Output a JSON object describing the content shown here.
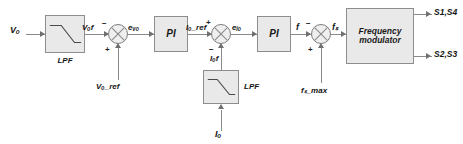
{
  "diagram": {
    "colors": {
      "block_fill": "#e9e9e9",
      "block_border": "#8d8d8d",
      "wire": "#8a8a8a",
      "text": "#141414",
      "background": "#ffffff"
    }
  },
  "signals": {
    "input_vo": "Vₒ",
    "vof": "Vₒf",
    "evo": "eᵥₒ",
    "io_ref": "Iₒ_ref",
    "eio": "eᵢₒ",
    "iof": "Iₒf",
    "f": "f",
    "fs": "fₛ",
    "fs_max": "fₛ_max",
    "vo_ref": "Vₒ_ref",
    "input_io": "Iₒ"
  },
  "blocks": {
    "lpf_voltage": {
      "label": "LPF",
      "caption_position": "below"
    },
    "pi_voltage": {
      "label": "PI"
    },
    "pi_current": {
      "label": "PI"
    },
    "lpf_current": {
      "label": "LPF",
      "caption_position": "right"
    },
    "modulator": {
      "label_line1": "Frequency",
      "label_line2": "modulator"
    }
  },
  "summing_junctions": {
    "voltage": {
      "left_sign": "−",
      "bottom_sign": "+"
    },
    "current": {
      "left_sign": "+",
      "bottom_sign": "−"
    },
    "frequency": {
      "left_sign": "−",
      "bottom_sign": "+"
    }
  },
  "outputs": {
    "top": "S1,S4",
    "bottom": "S2,S3"
  }
}
